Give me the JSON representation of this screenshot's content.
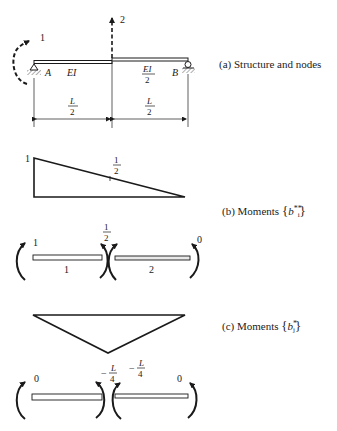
{
  "panel_a": {
    "caption": "(a) Structure and nodes",
    "node1_label": "1",
    "node2_label": "2",
    "support_left_label": "A",
    "support_right_label": "B",
    "left_stiffness": "EI",
    "right_stiffness_num": "EI",
    "right_stiffness_den": "2",
    "span_left_num": "L",
    "span_left_den": "2",
    "span_right_num": "L",
    "span_right_den": "2"
  },
  "panel_b": {
    "caption_prefix": "(b) Moments",
    "caption_symbol": "b",
    "caption_sub": "i",
    "caption_sup": "**",
    "diagram_left_value": "1",
    "diagram_mid_num": "1",
    "diagram_mid_den": "2",
    "member1_label": "1",
    "member2_label": "2",
    "end_left_value": "1",
    "joint_value_num": "1",
    "joint_value_den": "2",
    "end_right_value": "0"
  },
  "panel_c": {
    "caption_prefix": "(c) Moments",
    "caption_symbol": "b",
    "caption_sub": "j",
    "caption_sup": "*",
    "diagram_mid_sign": "−",
    "diagram_mid_num": "L",
    "diagram_mid_den": "4",
    "joint_value_sign": "−",
    "joint_value_num": "L",
    "joint_value_den": "4",
    "end_left_value": "0",
    "end_right_value": "0"
  }
}
